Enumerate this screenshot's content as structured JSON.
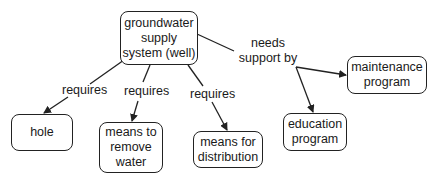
{
  "concept_map": {
    "nodes": {
      "root": "groundwater\nsupply\nsystem (well)",
      "hole": "hole",
      "remove": "means to\nremove\nwater",
      "distribution": "means for\ndistribution",
      "education": "education\nprogram",
      "maintenance": "maintenance\nprogram"
    },
    "links": {
      "requires_1": "requires",
      "requires_2": "requires",
      "requires_3": "requires",
      "needs_support": "needs\nsupport by"
    },
    "colors": {
      "stroke": "#222222",
      "background": "#ffffff"
    }
  }
}
